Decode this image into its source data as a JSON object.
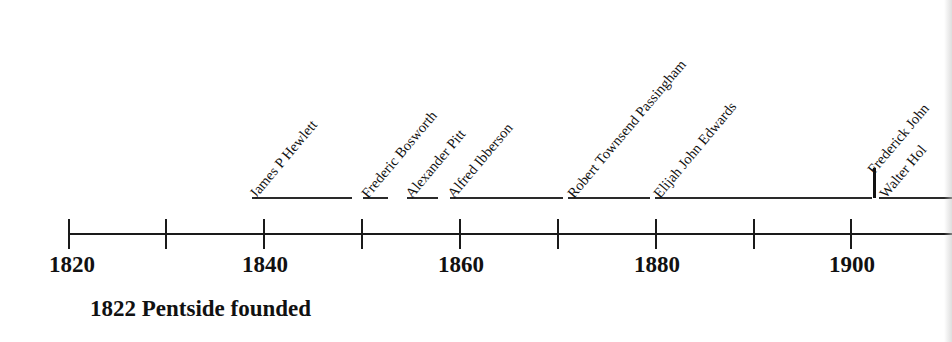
{
  "timeline": {
    "axis": {
      "start_year": 1820,
      "tick_interval_years": 10,
      "year_labels": [
        {
          "year": "1820",
          "x": 72
        },
        {
          "year": "1840",
          "x": 265
        },
        {
          "year": "1860",
          "x": 461
        },
        {
          "year": "1880",
          "x": 657
        },
        {
          "year": "1900",
          "x": 852
        }
      ],
      "ticks_x": [
        69,
        166,
        264,
        362,
        460,
        558,
        656,
        754,
        851
      ]
    },
    "names": [
      {
        "label": "James P Hewlett",
        "x": 258,
        "y": 172
      },
      {
        "label": "Frederic Bosworth",
        "x": 370,
        "y": 172
      },
      {
        "label": "Alexander Pitt",
        "x": 414,
        "y": 172
      },
      {
        "label": "Alfred Ibberson",
        "x": 456,
        "y": 172
      },
      {
        "label": "Robert Townsend Passingham",
        "x": 576,
        "y": 172
      },
      {
        "label": "Elijah John Edwards",
        "x": 662,
        "y": 172
      },
      {
        "label": "Frederick John",
        "x": 876,
        "y": 148
      },
      {
        "label": "Walter Hol",
        "x": 888,
        "y": 172
      }
    ],
    "segments": [
      {
        "left": 252,
        "width": 100
      },
      {
        "left": 363,
        "width": 25
      },
      {
        "left": 407,
        "width": 31
      },
      {
        "left": 450,
        "width": 113
      },
      {
        "left": 568,
        "width": 82
      },
      {
        "left": 655,
        "width": 217
      },
      {
        "left": 879,
        "width": 73
      }
    ],
    "caption": "1822 Pentside founded"
  }
}
